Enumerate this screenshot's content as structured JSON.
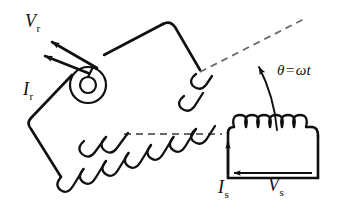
{
  "figure": {
    "type": "electrical-machine-schematic",
    "background_color": "#ffffff",
    "line_color": "#101010",
    "dashed_color": "#6b6b6b"
  },
  "labels": {
    "rotor_voltage": {
      "symbol": "V",
      "subscript": "r"
    },
    "rotor_current": {
      "symbol": "I",
      "subscript": "r"
    },
    "stator_current": {
      "symbol": "I",
      "subscript": "s"
    },
    "stator_voltage": {
      "symbol": "V",
      "subscript": "s"
    },
    "angle": {
      "theta": "θ",
      "equals": "=",
      "omega": "ω",
      "time": "t"
    }
  },
  "parts": {
    "rotor_coil": {
      "name": "rotor coil",
      "orientation": "tilted",
      "turns": 11,
      "shape": "rounded rectangle loop"
    },
    "stator_coil": {
      "name": "stator coil",
      "orientation": "horizontal",
      "turns": 6,
      "shape": "open rectangle loop"
    },
    "shaft": {
      "name": "rotor shaft",
      "shape": "concentric circles",
      "outer_radius": 18,
      "inner_radius": 8
    },
    "rotor_axis_dashed": {
      "name": "rotor axis reference line",
      "style": "dashed"
    },
    "stator_axis_dashed": {
      "name": "stator axis reference line",
      "style": "dashed"
    },
    "angle_arc": {
      "name": "rotation angle arc",
      "arrowhead": "at rotor axis"
    }
  }
}
